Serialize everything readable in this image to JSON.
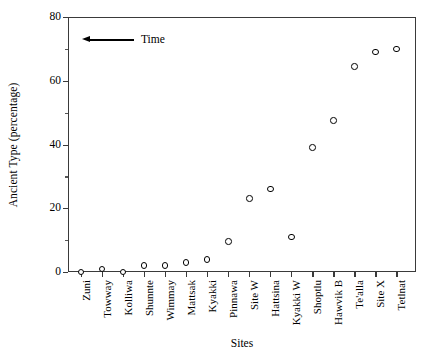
{
  "chart_data": {
    "type": "scatter",
    "title": "",
    "xlabel": "Sites",
    "ylabel": "Ancient Type (percentage)",
    "categories": [
      "Zuni",
      "Towway",
      "Kolliwa",
      "Shunnte",
      "Wimmay",
      "Mattsak",
      "Kyakki",
      "Pinnawa",
      "Site W",
      "Hattsina",
      "Kyakki W",
      "Shoptlu",
      "Hawvik B",
      "Te'alla",
      "Site X",
      "Tetlnat"
    ],
    "values": [
      0,
      1,
      0,
      2,
      2,
      3,
      4,
      9.5,
      23,
      26,
      11,
      39,
      47.5,
      64.5,
      69,
      70
    ],
    "ylim": [
      0,
      80
    ],
    "yticks": [
      0,
      20,
      40,
      60,
      80
    ],
    "ytick_labels": [
      "0",
      "20",
      "40",
      "60",
      "80"
    ],
    "yminor_ticks": [
      10,
      30,
      50,
      70
    ],
    "grid": false,
    "legend": "none",
    "marker": "open-circle",
    "marker_color": "#000000",
    "annotations": [
      {
        "text": "Time",
        "arrow_direction": "left"
      }
    ]
  },
  "axis": {
    "y_title": "Ancient Type (percentage)",
    "x_title": "Sites"
  },
  "annotation": {
    "time_label": "Time"
  },
  "colors": {
    "axis": "#3a3a3a",
    "marker_edge": "#000000",
    "marker_fill": "#ffffff",
    "background": "#ffffff"
  }
}
